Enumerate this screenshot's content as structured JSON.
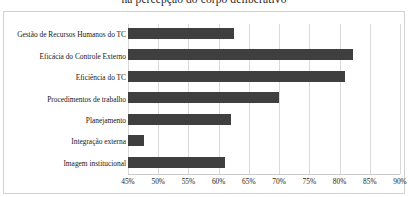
{
  "chart_data": {
    "type": "bar",
    "orientation": "horizontal",
    "title": "na percepção do corpo deliberativo",
    "xlabel": "",
    "ylabel": "",
    "xlim": [
      45,
      90
    ],
    "xticks": [
      "45%",
      "50%",
      "55%",
      "60%",
      "65%",
      "70%",
      "75%",
      "80%",
      "85%",
      "90%"
    ],
    "tick_step": 5,
    "grid": true,
    "legend": "none",
    "bar_color": "#3f3f3f",
    "grid_color": "#d9d9d9",
    "categories": [
      "Gestão de Recursos Humanos do TC",
      "Eficácia do Controle Externo",
      "Eficiência do TC",
      "Procedimentos de trabalho",
      "Planejamento",
      "Integração externa",
      "Imagem institucional"
    ],
    "values": [
      62.5,
      82.2,
      80.9,
      70.0,
      62.0,
      47.6,
      61.0
    ]
  }
}
